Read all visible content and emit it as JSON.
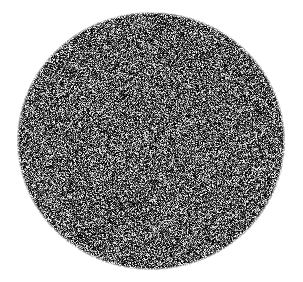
{
  "canvas": {
    "width": 303,
    "height": 282,
    "background_color": "#ffffff"
  },
  "figure": {
    "kind": "random-noise-disc",
    "shape": "ellipse",
    "center_x": 151,
    "center_y": 141,
    "radius_x": 133,
    "radius_y": 128,
    "bounds": {
      "left": 18,
      "top": 13,
      "right": 284,
      "bottom": 269
    },
    "edge_feather_px": 3
  },
  "noise": {
    "type": "grayscale-uniform-random",
    "granularity_px": 1,
    "min_value": 0,
    "max_value": 255,
    "mean_luminance": 90,
    "dark_bias": 0.62,
    "seed": 20240517,
    "color_low": "#000000",
    "color_high": "#ffffff"
  },
  "labels": {
    "title": "",
    "caption": "",
    "has_text": false
  }
}
